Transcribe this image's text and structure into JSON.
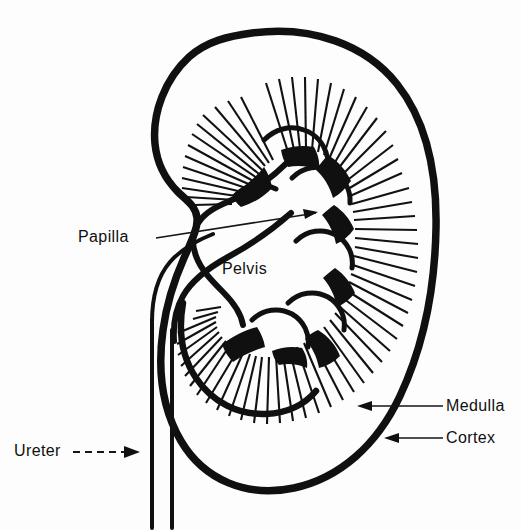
{
  "figure": {
    "background_color": "#fdfdfd",
    "ink_color": "#101010"
  },
  "labels": {
    "papilla": "Papilla",
    "pelvis": "Pelvis",
    "medulla": "Medulla",
    "cortex": "Cortex",
    "ureter": "Ureter"
  },
  "annotations": [
    {
      "name": "papilla",
      "text": "Papilla",
      "leader": "solid",
      "arrow": "right"
    },
    {
      "name": "pelvis",
      "text": "Pelvis",
      "leader": "none",
      "arrow": "none"
    },
    {
      "name": "medulla",
      "text": "Medulla",
      "leader": "solid",
      "arrow": "left"
    },
    {
      "name": "cortex",
      "text": "Cortex",
      "leader": "solid",
      "arrow": "left"
    },
    {
      "name": "ureter",
      "text": "Ureter",
      "leader": "dashed",
      "arrow": "right"
    }
  ],
  "structures": [
    "kidney-outline",
    "renal-cortex",
    "renal-medulla-striations",
    "renal-pelvis",
    "major-calyces",
    "renal-papillae",
    "ureter"
  ]
}
